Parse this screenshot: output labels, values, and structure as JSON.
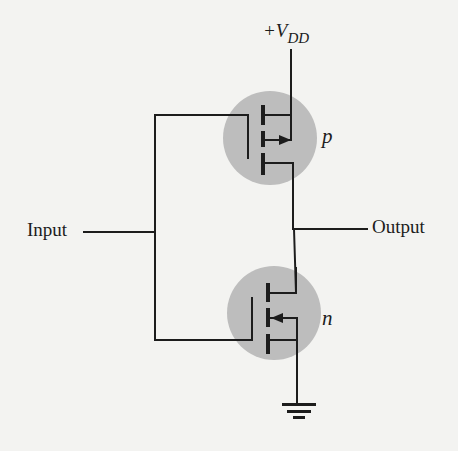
{
  "diagram": {
    "type": "circuit-schematic",
    "labels": {
      "supply_prefix": "+V",
      "supply_subscript": "DD",
      "input": "Input",
      "output": "Output",
      "pmos": "p",
      "nmos": "n"
    },
    "components": [
      {
        "id": "pmos",
        "kind": "p-channel MOSFET (enhancement)",
        "label": "p",
        "position": "top"
      },
      {
        "id": "nmos",
        "kind": "n-channel MOSFET (enhancement)",
        "label": "n",
        "position": "bottom"
      },
      {
        "id": "vdd",
        "kind": "supply",
        "label": "+VDD"
      },
      {
        "id": "gnd",
        "kind": "ground"
      }
    ],
    "connections": [
      "Input -> gate of p and gate of n (common gate bus)",
      "+VDD -> source of p",
      "drain of p -> Output",
      "drain of n -> Output",
      "source of n -> ground"
    ],
    "colors": {
      "background": "#f3f3f1",
      "wire": "#1c1c1c",
      "transistor_highlight": "#bdbdbd"
    }
  }
}
